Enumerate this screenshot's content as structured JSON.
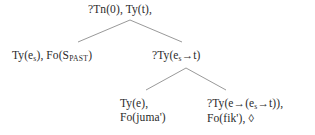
{
  "diagram": {
    "type": "semantic-parse-tree",
    "background_color": "#ffffff",
    "text_color": "#2b2b2b",
    "nodes": {
      "root": {
        "label": "?Tn(0), Ty(t),",
        "parts": {
          "requirement": "?Tn(0)",
          "type": "Ty(t)"
        }
      },
      "left_child": {
        "label": "Ty(e_s), Fo(S_PAST)",
        "parts": {
          "type_prefix": "Ty(e",
          "type_subscript": "s",
          "type_suffix": "), Fo(S",
          "formula_subscript": "PAST",
          "formula_suffix": ")"
        }
      },
      "right_child": {
        "label": "?Ty(e_s→t)",
        "parts": {
          "prefix": "?Ty(e",
          "subscript": "s",
          "arrow": "→",
          "suffix": "t)"
        }
      },
      "leaf_left": {
        "line1": "Ty(e),",
        "line2": "Fo(juma')"
      },
      "leaf_right": {
        "line1_prefix": "?Ty(e",
        "line1_arrow1": "→",
        "line1_mid": "(e",
        "line1_subscript": "s",
        "line1_arrow2": "→",
        "line1_suffix": "t)),",
        "line2": "Fo(fik'), ",
        "line2_diamond": "◊"
      }
    },
    "edges": [
      {
        "name": "root-to-left",
        "from": [
          130,
          20
        ],
        "to": [
          78,
          42
        ]
      },
      {
        "name": "root-to-right",
        "from": [
          130,
          20
        ],
        "to": [
          182,
          42
        ]
      },
      {
        "name": "right-to-leafleft",
        "from": [
          186,
          68
        ],
        "to": [
          146,
          90
        ]
      },
      {
        "name": "right-to-leafright",
        "from": [
          186,
          68
        ],
        "to": [
          226,
          90
        ]
      }
    ],
    "edge_color": "#8d8d8d"
  }
}
